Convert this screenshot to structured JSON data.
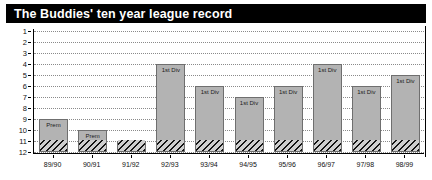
{
  "title": "The Buddies' ten year league record",
  "chart_data": {
    "type": "bar",
    "title": "The Buddies' ten year league record",
    "xlabel": "",
    "ylabel": "",
    "categories": [
      "89/90",
      "90/91",
      "91/92",
      "92/93",
      "93/94",
      "94/95",
      "95/96",
      "96/97",
      "97/98",
      "98/99"
    ],
    "values": [
      9,
      10,
      11,
      4,
      6,
      7,
      6,
      4,
      6,
      5
    ],
    "bar_labels": [
      "Prem",
      "Prem",
      "Prem",
      "1st Div",
      "1st Div",
      "1st Div",
      "1st Div",
      "1st Div",
      "1st Div",
      "1st Div"
    ],
    "ylim": [
      1,
      12
    ],
    "y_inverted": true,
    "y_ticks": [
      "1",
      "2",
      "3",
      "4",
      "5",
      "6",
      "7",
      "8",
      "9",
      "10",
      "11",
      "12"
    ],
    "grid": true,
    "legend": "none",
    "hatched_band": {
      "from": 11,
      "to": 12
    },
    "bar_color": "#b3b3b3",
    "bar_edge_color": "#6f6f6f",
    "hatch_color": "#151515",
    "title_background": "#000000",
    "title_color": "#ffffff"
  }
}
